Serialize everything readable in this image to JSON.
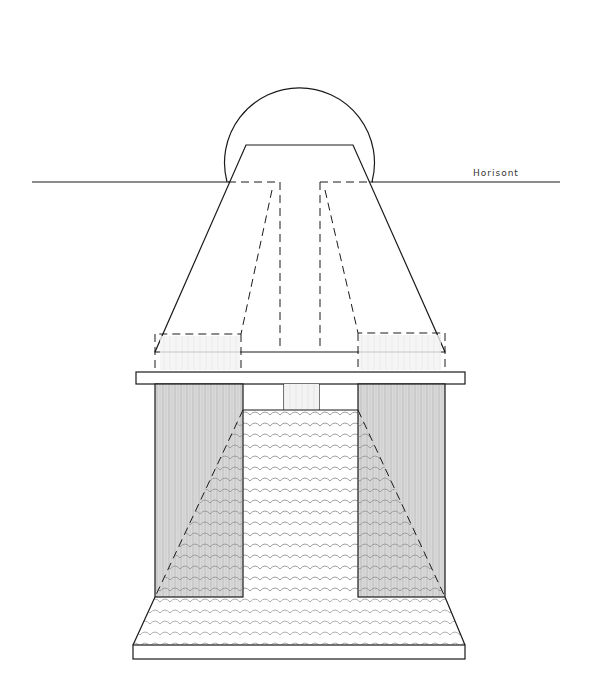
{
  "drawing": {
    "horizon_label": "Horisont",
    "colors": {
      "line": "#1a1a1a",
      "shade": "#c8c8c8",
      "paper": "#ffffff"
    }
  }
}
